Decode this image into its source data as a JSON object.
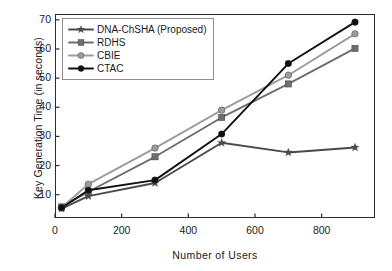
{
  "chart_data": {
    "type": "line",
    "title": "",
    "xlabel": "Number of Users",
    "ylabel": "Key Generation Time (in seconds)",
    "xlim": [
      0,
      960
    ],
    "ylim": [
      2,
      72
    ],
    "xticks": [
      "0",
      "200",
      "400",
      "600",
      "800"
    ],
    "xtick_values": [
      0,
      200,
      400,
      600,
      800
    ],
    "yticks": [
      "10",
      "20",
      "30",
      "40",
      "50",
      "60",
      "70"
    ],
    "ytick_values": [
      10,
      20,
      30,
      40,
      50,
      60,
      70
    ],
    "grid": false,
    "legend_position": "upper-left",
    "x": [
      20,
      100,
      300,
      500,
      700,
      900
    ],
    "series": [
      {
        "name": "DNA-ChSHA (Proposed)",
        "values": [
          5.2,
          9.5,
          14.0,
          27.8,
          24.5,
          26.2
        ],
        "color": "#4a4a4a",
        "marker": "star"
      },
      {
        "name": "RDHS",
        "values": [
          5.8,
          11.0,
          23.0,
          36.5,
          48.0,
          60.2
        ],
        "color": "#6e6e6e",
        "marker": "square"
      },
      {
        "name": "CBIE",
        "values": [
          5.6,
          13.6,
          26.0,
          39.0,
          51.0,
          65.2
        ],
        "color": "#9c9c9c",
        "marker": "circle"
      },
      {
        "name": "CTAC",
        "values": [
          5.5,
          11.5,
          15.0,
          30.8,
          55.0,
          69.2
        ],
        "color": "#101010",
        "marker": "circle"
      }
    ]
  },
  "legend": {
    "items": [
      {
        "label": "DNA-ChSHA (Proposed)"
      },
      {
        "label": "RDHS"
      },
      {
        "label": "CBIE"
      },
      {
        "label": "CTAC"
      }
    ]
  }
}
